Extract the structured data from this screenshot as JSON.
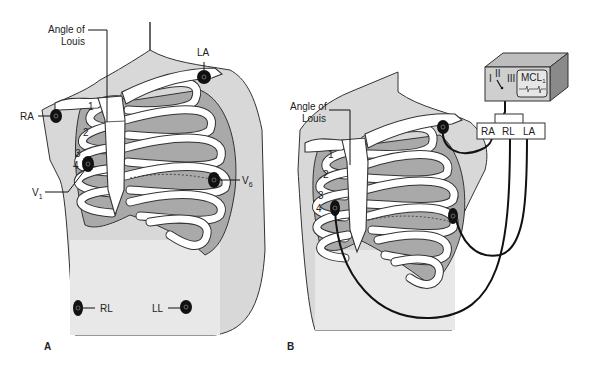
{
  "figure": {
    "panel_a": {
      "label": "A",
      "annotations": {
        "angle_of_louis_line1": "Angle of",
        "angle_of_louis_line2": "Louis",
        "ra": "RA",
        "la": "LA",
        "v1": "V",
        "v1_sub": "1",
        "v6": "V",
        "v6_sub": "6",
        "rl": "RL",
        "ll": "LL"
      },
      "rib_numbers": [
        "1",
        "2",
        "3",
        "4"
      ]
    },
    "panel_b": {
      "label": "B",
      "annotations": {
        "angle_of_louis_line1": "Angle of",
        "angle_of_louis_line2": "Louis"
      },
      "rib_numbers": [
        "1",
        "2",
        "3",
        "4"
      ],
      "monitor": {
        "lead_options": [
          "I",
          "II",
          "III"
        ],
        "display_label": "MCL",
        "display_label_sub": "1"
      },
      "connector": {
        "labels": [
          "RA",
          "RL",
          "LA"
        ]
      }
    },
    "colors": {
      "skin": "#d8d8d8",
      "lung": "#a9a9a9",
      "bone": "#ffffff",
      "outline": "#333333",
      "electrode": "#111111"
    }
  }
}
